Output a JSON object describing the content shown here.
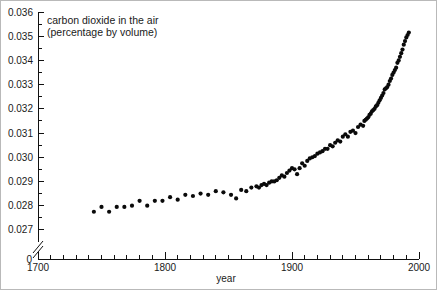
{
  "figure": {
    "title_line1": "carbon dioxide in the air",
    "title_line2": "(percentage by volume)",
    "xlabel": "year",
    "ylabel": "",
    "zero_label": "0",
    "background": "#ffffff",
    "point_color": "#0a0a0a",
    "axis_color": "#111111"
  },
  "chart_data": {
    "type": "scatter",
    "title": "carbon dioxide in the air (percentage by volume)",
    "xlabel": "year",
    "ylabel": "carbon dioxide in the air (percentage by volume)",
    "xlim": [
      1700,
      2000
    ],
    "ylim": [
      0.0265,
      0.036
    ],
    "grid": false,
    "legend": null,
    "axis_break_y": true,
    "axis_break_note": "y-axis broken between 0 and 0.0265",
    "x_ticks_major": [
      1700,
      1800,
      1900,
      2000
    ],
    "x_tick_labels": [
      "1700",
      "1800",
      "1900",
      "2000"
    ],
    "x_tick_minor_step": 10,
    "y_ticks_major": [
      0.027,
      0.028,
      0.029,
      0.03,
      0.031,
      0.032,
      0.033,
      0.034,
      0.035,
      0.036
    ],
    "y_tick_labels": [
      "0.027",
      "0.028",
      "0.029",
      "0.030",
      "0.031",
      "0.032",
      "0.033",
      "0.034",
      "0.035",
      "0.036"
    ],
    "y_tick_minor_step": 0.0005,
    "marker": "filled-circle",
    "marker_size_px": 4,
    "x": [
      1744,
      1750,
      1756,
      1762,
      1768,
      1774,
      1780,
      1786,
      1792,
      1798,
      1804,
      1810,
      1816,
      1822,
      1828,
      1834,
      1840,
      1846,
      1852,
      1856,
      1860,
      1864,
      1868,
      1872,
      1874,
      1876,
      1878,
      1880,
      1882,
      1884,
      1886,
      1888,
      1890,
      1892,
      1894,
      1896,
      1898,
      1900,
      1902,
      1904,
      1906,
      1908,
      1910,
      1912,
      1914,
      1916,
      1918,
      1920,
      1922,
      1924,
      1926,
      1928,
      1930,
      1932,
      1934,
      1936,
      1938,
      1940,
      1942,
      1944,
      1946,
      1948,
      1950,
      1952,
      1954,
      1956,
      1957,
      1958,
      1959,
      1960,
      1961,
      1962,
      1963,
      1964,
      1965,
      1966,
      1967,
      1968,
      1969,
      1970,
      1971,
      1972,
      1973,
      1974,
      1975,
      1976,
      1977,
      1978,
      1979,
      1980,
      1981,
      1982,
      1983,
      1984,
      1985,
      1986,
      1987,
      1988,
      1989,
      1990,
      1991,
      1992
    ],
    "y": [
      0.02775,
      0.02795,
      0.02775,
      0.02795,
      0.02795,
      0.028,
      0.0282,
      0.028,
      0.0282,
      0.0282,
      0.02835,
      0.02825,
      0.02845,
      0.0284,
      0.0285,
      0.02845,
      0.0286,
      0.02855,
      0.02845,
      0.0283,
      0.02865,
      0.0286,
      0.02875,
      0.0288,
      0.02875,
      0.02885,
      0.0289,
      0.02885,
      0.02895,
      0.029,
      0.029,
      0.02905,
      0.02915,
      0.02925,
      0.0292,
      0.02935,
      0.02945,
      0.02955,
      0.0295,
      0.0293,
      0.02955,
      0.02975,
      0.02965,
      0.02985,
      0.02995,
      0.03,
      0.03005,
      0.03015,
      0.0302,
      0.03025,
      0.03035,
      0.03035,
      0.0305,
      0.03045,
      0.0306,
      0.0307,
      0.03065,
      0.03085,
      0.03095,
      0.03085,
      0.03105,
      0.0311,
      0.031,
      0.03125,
      0.03135,
      0.0313,
      0.0315,
      0.03155,
      0.0316,
      0.03165,
      0.03175,
      0.0318,
      0.0319,
      0.03195,
      0.032,
      0.0321,
      0.03215,
      0.03225,
      0.03235,
      0.03245,
      0.03255,
      0.03265,
      0.0328,
      0.03285,
      0.0329,
      0.033,
      0.03315,
      0.03325,
      0.0334,
      0.0335,
      0.0336,
      0.0337,
      0.0339,
      0.034,
      0.03415,
      0.0343,
      0.03445,
      0.03465,
      0.0348,
      0.03495,
      0.03505,
      0.03515
    ]
  }
}
